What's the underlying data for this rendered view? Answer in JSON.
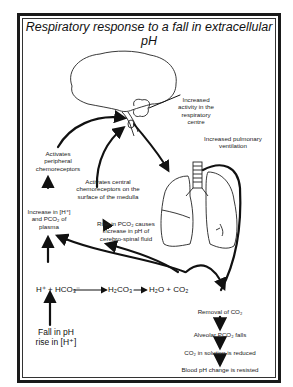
{
  "title": "Respiratory response to a fall in extracellular pH",
  "labels": {
    "resp_centre": [
      "Increased",
      "activity in the",
      "respiratory",
      "centre"
    ],
    "pulmonary": [
      "Increased pulmonary",
      "ventilation"
    ],
    "peripheral": [
      "Activates",
      "peripheral",
      "chemoreceptors"
    ],
    "central": [
      "Activates central",
      "chemoreceptors on the",
      "surface of the medulla"
    ],
    "increase_h": [
      "Increase in [H⁺]",
      "and PCO₂ of",
      "plasma"
    ],
    "rise_pco2": [
      "Rise in PCO₂ causes",
      "increase in pH of",
      "cerebro-spinal fluid"
    ],
    "equation": {
      "reactants": "H⁺ + HCO₃⁻",
      "intermediate": "H₂CO₃",
      "products": "H₂O + CO₂"
    },
    "fall_ph": [
      "Fall in pH",
      "rise in [H⁺]"
    ],
    "cascade": [
      "Removal of CO₂",
      "Alveolar PCO₂ falls",
      "CO₂ in solution is reduced",
      "Blood pH change is resisted"
    ]
  }
}
